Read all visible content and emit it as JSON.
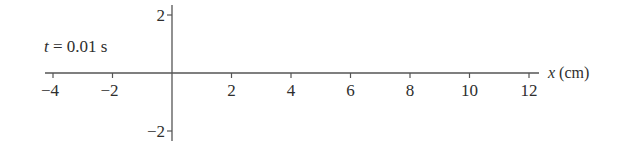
{
  "chart_data": {
    "type": "line",
    "title": "",
    "annotation": "t = 0.01 s",
    "xlabel": "x (cm)",
    "ylabel": "",
    "xlim": [
      -4,
      12
    ],
    "ylim": [
      -2,
      2
    ],
    "x_ticks": [
      -4,
      -2,
      2,
      4,
      6,
      8,
      10,
      12
    ],
    "x_tick_labels": [
      "−4",
      "−2",
      "2",
      "4",
      "6",
      "8",
      "10",
      "12"
    ],
    "y_ticks": [
      2,
      -2
    ],
    "y_tick_labels": [
      "2",
      "−2"
    ],
    "grid": false,
    "legend": null,
    "series": []
  },
  "colors": {
    "axis": "#555555",
    "text": "#2e2e2e"
  }
}
